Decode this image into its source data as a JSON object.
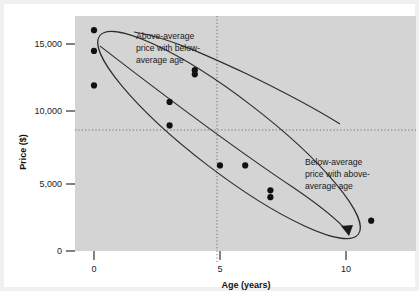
{
  "figure": {
    "background": "#ffffff",
    "plot_background": "#d4d4d4",
    "frame_color": "#f0f0f0",
    "ink_color": "#1a1a1a"
  },
  "chart_data": {
    "type": "scatter",
    "title": "",
    "subtitle": "",
    "xlabel": "Age (years)",
    "ylabel": "Price ($)",
    "xlim": [
      -0.7,
      12.8
    ],
    "ylim": [
      -600,
      17300
    ],
    "grid": false,
    "legend_position": "none",
    "x_ticks": [
      0,
      5,
      10
    ],
    "x_tick_labels": [
      "0",
      "5",
      "10"
    ],
    "y_ticks": [
      0,
      5000,
      10000,
      15000
    ],
    "y_tick_labels": [
      "0",
      "5,000",
      "10,000",
      "15,000"
    ],
    "series": [
      {
        "name": "Used car price vs age",
        "marker": "filled-circle",
        "color": "#111111",
        "points": [
          {
            "x": 0,
            "y": 16000
          },
          {
            "x": 0,
            "y": 14500
          },
          {
            "x": 0,
            "y": 12000
          },
          {
            "x": 4,
            "y": 13100
          },
          {
            "x": 4,
            "y": 12800
          },
          {
            "x": 3,
            "y": 10800
          },
          {
            "x": 3,
            "y": 9100
          },
          {
            "x": 5,
            "y": 6200
          },
          {
            "x": 6,
            "y": 6200
          },
          {
            "x": 7,
            "y": 4400
          },
          {
            "x": 7,
            "y": 3900
          },
          {
            "x": 11,
            "y": 2200
          }
        ]
      }
    ],
    "reference_lines": [
      {
        "name": "mean-price",
        "orientation": "horizontal",
        "value": 8700,
        "style": "dotted"
      },
      {
        "name": "mean-age",
        "orientation": "vertical",
        "value": 4.5,
        "style": "dotted"
      }
    ],
    "overlays": [
      {
        "name": "data-ellipse",
        "type": "ellipse",
        "style": "solid-outline"
      }
    ],
    "annotations": [
      {
        "id": "above-average",
        "lines": [
          "Above-average",
          "price with below-",
          "average age"
        ],
        "text": "Above-average price with below-average age",
        "leader": "curve-to-upper-left-region"
      },
      {
        "id": "below-average",
        "lines": [
          "Below-average",
          "price with above-",
          "average age"
        ],
        "text": "Below-average price with above-average age",
        "leader": "curve-with-arrow-to-lower-right"
      }
    ]
  }
}
